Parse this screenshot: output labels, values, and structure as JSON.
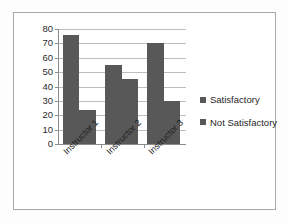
{
  "chart_data": {
    "type": "bar",
    "title": "",
    "subtitle": "",
    "xlabel": "",
    "ylabel": "",
    "categories": [
      "Instructor 1",
      "Instructor 2",
      "Instructor 3"
    ],
    "series": [
      {
        "name": "Satisfactory",
        "values": [
          76,
          55,
          70
        ],
        "color": "#585858"
      },
      {
        "name": "Not Satisfactory",
        "values": [
          24,
          45,
          30
        ],
        "color": "#585858"
      }
    ],
    "ylim": [
      0,
      80
    ],
    "ytick_step": 10,
    "yticks": [
      0,
      10,
      20,
      30,
      40,
      50,
      60,
      70,
      80
    ],
    "ytick_labels": [
      "0",
      "10",
      "20",
      "30",
      "40",
      "50",
      "60",
      "70",
      "80"
    ],
    "grid": "horizontal",
    "legend_position": "right",
    "legend": [
      "Satisfactory",
      "Not Satisfactory"
    ],
    "annotations": []
  },
  "legend": {
    "items": [
      {
        "label": "Satisfactory",
        "marker": "square-marker",
        "color": "#585858"
      },
      {
        "label": "Not Satisfactory",
        "marker": "square-marker",
        "color": "#585858"
      }
    ]
  },
  "colors": {
    "bar": "#585858",
    "gridline": "#bdbdbd",
    "axis": "#8c8c8c",
    "frame_border": "#a9a9a9",
    "plot_background": "#ffffff",
    "page_background": "#fdfdfd",
    "text": "#1f1f1f"
  }
}
